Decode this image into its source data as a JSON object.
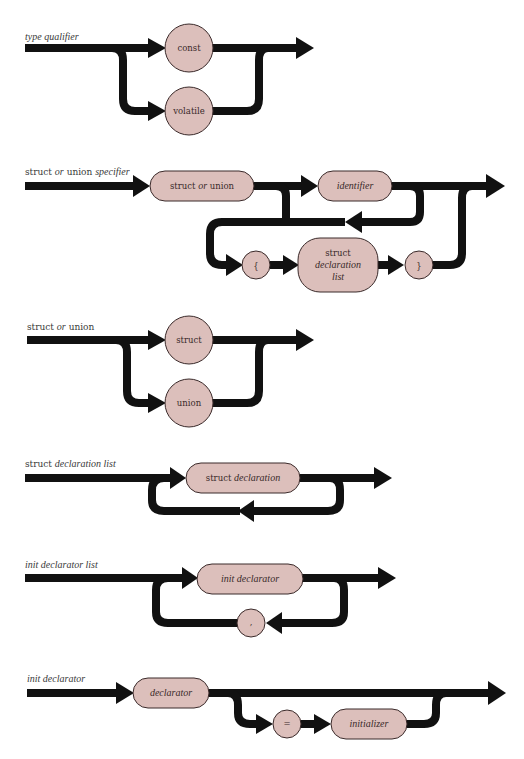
{
  "page_number": "",
  "diagrams": [
    {
      "id": "type-qualifier",
      "title": {
        "roman": "",
        "italic": "type qualifier"
      },
      "nodes": [
        {
          "shape": "circle",
          "text": "const",
          "style": "roman"
        },
        {
          "shape": "circle",
          "text": "volatile",
          "style": "roman"
        }
      ]
    },
    {
      "id": "struct-or-union-specifier",
      "title": {
        "part1": "struct ",
        "part2": "or",
        "part3": " union ",
        "part4": "specifier"
      },
      "nodes": [
        {
          "shape": "rounded",
          "text1": "struct ",
          "text2": "or",
          "text3": " union"
        },
        {
          "shape": "rounded",
          "text": "identifier",
          "style": "italic"
        },
        {
          "shape": "circle",
          "text": "{",
          "style": "roman"
        },
        {
          "shape": "rounded",
          "line1": "struct",
          "line2": "declaration",
          "line3": "list"
        },
        {
          "shape": "circle",
          "text": "}",
          "style": "roman"
        }
      ]
    },
    {
      "id": "struct-or-union",
      "title": {
        "part1": "struct ",
        "part2": "or",
        "part3": " union"
      },
      "nodes": [
        {
          "shape": "circle",
          "text": "struct",
          "style": "roman"
        },
        {
          "shape": "circle",
          "text": "union",
          "style": "roman"
        }
      ]
    },
    {
      "id": "struct-declaration-list",
      "title": {
        "part1": "struct ",
        "part2": "declaration list"
      },
      "nodes": [
        {
          "shape": "rounded",
          "text1": "struct ",
          "text2": "declaration"
        }
      ]
    },
    {
      "id": "init-declarator-list",
      "title": {
        "italic": "init declarator list"
      },
      "nodes": [
        {
          "shape": "rounded",
          "text": "init declarator",
          "style": "italic"
        },
        {
          "shape": "circle",
          "text": ",",
          "style": "roman"
        }
      ]
    },
    {
      "id": "init-declarator",
      "title": {
        "italic": "init declarator"
      },
      "nodes": [
        {
          "shape": "rounded",
          "text": "declarator",
          "style": "italic"
        },
        {
          "shape": "circle",
          "text": "=",
          "style": "roman"
        },
        {
          "shape": "rounded",
          "text": "initializer",
          "style": "italic"
        }
      ]
    }
  ],
  "colors": {
    "node_fill": "#dcbfbb",
    "line": "#111111",
    "background": "#ffffff"
  }
}
